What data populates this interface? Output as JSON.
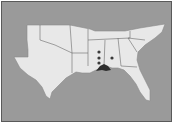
{
  "map": {
    "region": "Southeastern United States",
    "states": [
      "Texas",
      "Oklahoma",
      "Arkansas",
      "Louisiana",
      "Mississippi",
      "Tennessee",
      "Alabama",
      "Georgia",
      "Florida",
      "South Carolina",
      "North Carolina"
    ],
    "colors": {
      "background": "#9a9a9a",
      "land": "#e8e8e8",
      "border": "#6a6a6a",
      "marker": "#3a3a3a",
      "range": "#2e2e2e"
    },
    "markers": [
      {
        "x": 99,
        "y": 52,
        "state": "Mississippi"
      },
      {
        "x": 99,
        "y": 58,
        "state": "Mississippi"
      },
      {
        "x": 99,
        "y": 63,
        "state": "Mississippi"
      },
      {
        "x": 112,
        "y": 58,
        "state": "Alabama"
      }
    ],
    "shaded_range": {
      "label": "Gulf coast range",
      "state": "Mississippi/Alabama coast"
    }
  }
}
